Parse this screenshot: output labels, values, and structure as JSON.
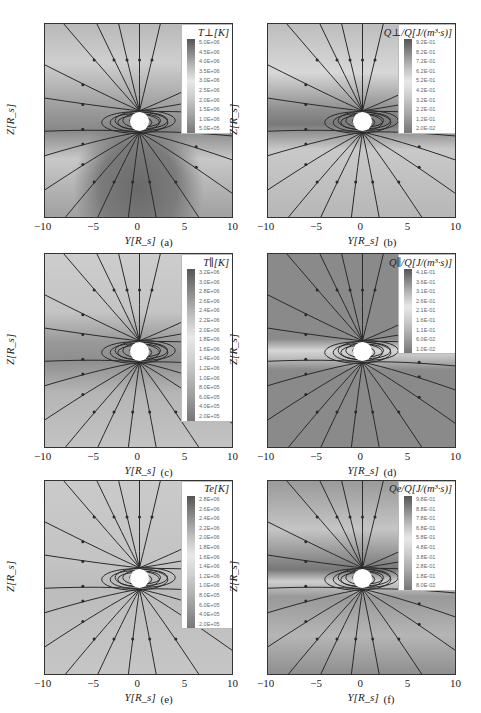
{
  "figure": {
    "panels": [
      {
        "id": "a",
        "label": "(a)",
        "xlabel": "Y[R_s]",
        "ylabel": "Z[R_s]",
        "legend_title": "T⊥[K]",
        "legend_values": [
          "5.0E+06",
          "4.5E+06",
          "4.0E+06",
          "3.5E+06",
          "3.0E+06",
          "2.5E+06",
          "2.0E+06",
          "1.5E+06",
          "1.0E+06",
          "5.0E+05"
        ]
      },
      {
        "id": "b",
        "label": "(b)",
        "xlabel": "Y[R_s]",
        "ylabel": "Z[R_s]",
        "legend_title": "Q⊥/Q[J/(m³·s)]",
        "legend_values": [
          "9.2E-01",
          "8.2E-01",
          "7.2E-01",
          "6.2E-01",
          "5.2E-01",
          "4.2E-01",
          "3.2E-01",
          "2.2E-01",
          "1.2E-01",
          "2.0E-02"
        ]
      },
      {
        "id": "c",
        "label": "(c)",
        "xlabel": "Y[R_s]",
        "ylabel": "Z[R_s]",
        "legend_title": "T∥[K]",
        "legend_values": [
          "3.2E+06",
          "3.0E+06",
          "2.8E+06",
          "2.6E+06",
          "2.4E+06",
          "2.2E+06",
          "2.0E+06",
          "1.8E+06",
          "1.6E+06",
          "1.4E+06",
          "1.2E+06",
          "1.0E+06",
          "8.0E+05",
          "6.0E+05",
          "4.0E+05",
          "2.0E+05"
        ]
      },
      {
        "id": "d",
        "label": "(d)",
        "xlabel": "Y[R_s]",
        "ylabel": "Z[R_s]",
        "legend_title": "Q∥/Q[J/(m³·s)]",
        "legend_values": [
          "4.1E-01",
          "3.6E-01",
          "3.1E-01",
          "2.6E-01",
          "2.1E-01",
          "1.6E-01",
          "1.1E-01",
          "6.0E-02",
          "1.0E-02"
        ]
      },
      {
        "id": "e",
        "label": "(e)",
        "xlabel": "Y[R_s]",
        "ylabel": "Z[R_s]",
        "legend_title": "Te[K]",
        "legend_values": [
          "2.8E+06",
          "2.6E+06",
          "2.4E+06",
          "2.2E+06",
          "2.0E+06",
          "1.8E+06",
          "1.6E+06",
          "1.4E+06",
          "1.2E+06",
          "1.0E+06",
          "8.0E+05",
          "6.0E+05",
          "4.0E+05",
          "2.0E+05"
        ]
      },
      {
        "id": "f",
        "label": "(f)",
        "xlabel": "Y[R_s]",
        "ylabel": "Z[R_s]",
        "legend_title": "Qe/Q[J/(m³·s)]",
        "legend_values": [
          "9.8E-01",
          "8.8E-01",
          "7.8E-01",
          "6.8E-01",
          "5.8E-01",
          "4.8E-01",
          "3.8E-01",
          "2.8E-01",
          "1.8E-01",
          "8.0E-02"
        ]
      }
    ],
    "xticks": [
      "−10",
      "−5",
      "0",
      "5",
      "10"
    ],
    "yticks": [
      "10",
      "5",
      "0",
      "−5",
      "−10"
    ]
  },
  "chart_data": [
    {
      "type": "heatmap",
      "panel": "(a)",
      "title": "T⊥ [K]",
      "xlabel": "Y[Rs]",
      "ylabel": "Z[Rs]",
      "xlim": [
        -10,
        10
      ],
      "ylim": [
        -10,
        10
      ],
      "xticks": [
        -10,
        -5,
        0,
        5,
        10
      ],
      "yticks": [
        -10,
        -5,
        0,
        5,
        10
      ],
      "colorbar": [
        5000000.0,
        4500000.0,
        4000000.0,
        3500000.0,
        3000000.0,
        2500000.0,
        2000000.0,
        1500000.0,
        1000000.0,
        500000.0
      ],
      "overlay": "magnetic field lines with arrows, white occulting disk at origin",
      "legend_position": "upper right"
    },
    {
      "type": "heatmap",
      "panel": "(b)",
      "title": "Q⊥/Q [J/(m³·s)]",
      "xlabel": "Y[Rs]",
      "ylabel": "Z[Rs]",
      "xlim": [
        -10,
        10
      ],
      "ylim": [
        -10,
        10
      ],
      "xticks": [
        -10,
        -5,
        0,
        5,
        10
      ],
      "yticks": [
        -10,
        -5,
        0,
        5,
        10
      ],
      "colorbar": [
        0.92,
        0.82,
        0.72,
        0.62,
        0.52,
        0.42,
        0.32,
        0.22,
        0.12,
        0.02
      ],
      "overlay": "magnetic field lines with arrows",
      "legend_position": "upper right"
    },
    {
      "type": "heatmap",
      "panel": "(c)",
      "title": "T∥ [K]",
      "xlabel": "Y[Rs]",
      "ylabel": "Z[Rs]",
      "xlim": [
        -10,
        10
      ],
      "ylim": [
        -10,
        10
      ],
      "xticks": [
        -10,
        -5,
        0,
        5,
        10
      ],
      "yticks": [
        -10,
        -5,
        0,
        5,
        10
      ],
      "colorbar": [
        3200000.0,
        3000000.0,
        2800000.0,
        2600000.0,
        2400000.0,
        2200000.0,
        2000000.0,
        1800000.0,
        1600000.0,
        1400000.0,
        1200000.0,
        1000000.0,
        800000.0,
        600000.0,
        400000.0,
        200000.0
      ],
      "overlay": "magnetic field lines with arrows",
      "legend_position": "upper right"
    },
    {
      "type": "heatmap",
      "panel": "(d)",
      "title": "Q∥/Q [J/(m³·s)]",
      "xlabel": "Y[Rs]",
      "ylabel": "Z[Rs]",
      "xlim": [
        -10,
        10
      ],
      "ylim": [
        -10,
        10
      ],
      "xticks": [
        -10,
        -5,
        0,
        5,
        10
      ],
      "yticks": [
        -10,
        -5,
        0,
        5,
        10
      ],
      "colorbar": [
        0.41,
        0.36,
        0.31,
        0.26,
        0.21,
        0.16,
        0.11,
        0.06,
        0.01
      ],
      "overlay": "magnetic field lines with arrows",
      "legend_position": "upper right"
    },
    {
      "type": "heatmap",
      "panel": "(e)",
      "title": "Te [K]",
      "xlabel": "Y[Rs]",
      "ylabel": "Z[Rs]",
      "xlim": [
        -10,
        10
      ],
      "ylim": [
        -10,
        10
      ],
      "xticks": [
        -10,
        -5,
        0,
        5,
        10
      ],
      "yticks": [
        -10,
        -5,
        0,
        5,
        10
      ],
      "colorbar": [
        2800000.0,
        2600000.0,
        2400000.0,
        2200000.0,
        2000000.0,
        1800000.0,
        1600000.0,
        1400000.0,
        1200000.0,
        1000000.0,
        800000.0,
        600000.0,
        400000.0,
        200000.0
      ],
      "overlay": "magnetic field lines with arrows",
      "legend_position": "upper right"
    },
    {
      "type": "heatmap",
      "panel": "(f)",
      "title": "Qe/Q [J/(m³·s)]",
      "xlabel": "Y[Rs]",
      "ylabel": "Z[Rs]",
      "xlim": [
        -10,
        10
      ],
      "ylim": [
        -10,
        10
      ],
      "xticks": [
        -10,
        -5,
        0,
        5,
        10
      ],
      "yticks": [
        -10,
        -5,
        0,
        5,
        10
      ],
      "colorbar": [
        0.98,
        0.88,
        0.78,
        0.68,
        0.58,
        0.48,
        0.38,
        0.28,
        0.18,
        0.08
      ],
      "overlay": "magnetic field lines with arrows",
      "legend_position": "upper right"
    }
  ]
}
